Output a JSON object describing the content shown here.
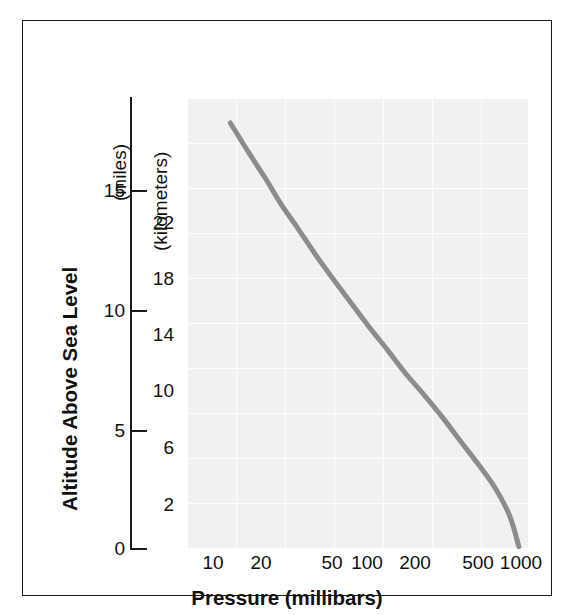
{
  "chart_data": {
    "type": "line",
    "title": "",
    "xlabel": "Pressure (millibars)",
    "ylabel": "Altitude Above Sea Level",
    "x_scale": "log",
    "xlim": [
      7,
      1200
    ],
    "x_ticks": [
      10,
      20,
      50,
      100,
      200,
      500,
      1000
    ],
    "x_tick_labels": [
      "10",
      "20",
      "50",
      "100",
      "200",
      "500",
      "1000"
    ],
    "y_primary_unit": "(miles)",
    "y_primary_ticks": [
      0,
      5,
      10,
      15
    ],
    "y_primary_tick_labels": [
      "0",
      "5",
      "10",
      "15"
    ],
    "y_primary_lim": [
      0,
      18.5
    ],
    "y_secondary_unit": "(kilometers)",
    "y_secondary_ticks": [
      2,
      6,
      10,
      14,
      18,
      22
    ],
    "y_secondary_tick_labels": [
      "2",
      "6",
      "10",
      "14",
      "18",
      "22"
    ],
    "y_secondary_lim": [
      0,
      29.8
    ],
    "grid": true,
    "grid_color": "#ffffff",
    "plot_background": "#f1f1f1",
    "line_color": "#8c8c8c",
    "line_width": 5,
    "legend": null,
    "series": [
      {
        "name": "Standard atmosphere pressure vs altitude",
        "x": [
          8.5,
          10,
          13,
          17,
          22,
          28,
          36,
          47,
          61,
          80,
          105,
          140,
          185,
          245,
          320,
          420,
          540,
          700,
          880,
          1013
        ],
        "y_km": [
          31.8,
          30.5,
          28.6,
          26.7,
          24.9,
          23.2,
          21.5,
          19.8,
          18.2,
          16.5,
          14.9,
          13.3,
          11.8,
          10.3,
          8.8,
          7.3,
          5.8,
          4.2,
          2.3,
          0.2
        ],
        "y_miles": [
          19.8,
          19.0,
          17.8,
          16.6,
          15.5,
          14.4,
          13.4,
          12.3,
          11.3,
          10.3,
          9.3,
          8.3,
          7.3,
          6.4,
          5.5,
          4.5,
          3.6,
          2.6,
          1.4,
          0.1
        ]
      }
    ]
  },
  "axes": {
    "x_title": "Pressure (millibars)",
    "y_title": "Altitude Above Sea Level",
    "miles_caption": "(miles)",
    "km_caption": "(kilometers)",
    "miles_labels": [
      "15",
      "10",
      "5",
      "0"
    ],
    "km_labels": [
      "22",
      "18",
      "14",
      "10",
      "6",
      "2"
    ],
    "x_labels": [
      "10",
      "20",
      "50",
      "100",
      "200",
      "500",
      "1000"
    ]
  }
}
